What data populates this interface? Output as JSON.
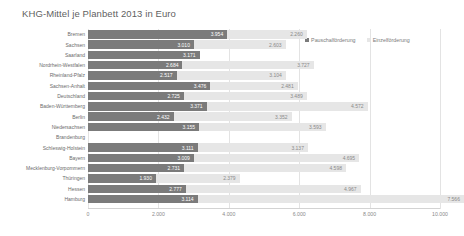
{
  "chart_data": {
    "type": "bar",
    "title": "KHG-Mittel je Planbett 2013 in Euro",
    "xlabel": "",
    "ylabel": "",
    "orientation": "horizontal",
    "stacked": true,
    "grid": true,
    "legend_position": "top-right",
    "xlim": [
      0,
      10000
    ],
    "xticks": [
      "0",
      "2.000",
      "4.000",
      "6.000",
      "8.000",
      "10.000"
    ],
    "xtick_values": [
      0,
      2000,
      4000,
      6000,
      8000,
      10000
    ],
    "categories": [
      "Bremen",
      "Sachsen",
      "Saarland",
      "Nordrhein-Westfalen",
      "Rheinland-Pfalz",
      "Sachsen-Anhalt",
      "Deutschland",
      "Baden-Württemberg",
      "Berlin",
      "Niedersachsen",
      "Brandenburg",
      "Schleswig-Holstein",
      "Bayern",
      "Mecklenburg-Vorpommern",
      "Thüringen",
      "Hessen",
      "Hamburg"
    ],
    "series": [
      {
        "name": "Pauschalförderung",
        "color": "#7b7b7b",
        "values": [
          3954,
          3010,
          3171,
          2684,
          2517,
          3476,
          2725,
          3371,
          2432,
          3155,
          null,
          3111,
          3009,
          2731,
          1930,
          2777,
          3114
        ],
        "labels": [
          "3.954",
          "3.010",
          "3.171",
          "2.684",
          "2.517",
          "3.476",
          "2.725",
          "3.371",
          "2.432",
          "3.155",
          "",
          "3.111",
          "3.009",
          "2.731",
          "1.930",
          "2.777",
          "3.114"
        ]
      },
      {
        "name": "Einzelförderung",
        "color": "#e6e6e6",
        "values": [
          2260,
          2603,
          null,
          3727,
          3104,
          2481,
          3489,
          4572,
          3352,
          3593,
          null,
          3137,
          4695,
          4598,
          2379,
          4967,
          7566
        ],
        "labels": [
          "2.260",
          "2.603",
          "",
          "3.727",
          "3.104",
          "2.481",
          "3.489",
          "4.572",
          "3.352",
          "3.593",
          "",
          "3.137",
          "4.695",
          "4.598",
          "2.379",
          "4.967",
          "7.566"
        ]
      }
    ]
  }
}
